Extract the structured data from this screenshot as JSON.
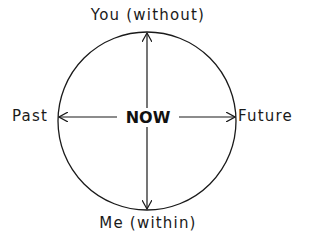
{
  "diagram": {
    "type": "compass-circle",
    "top_label": "You (without)",
    "bottom_label": "Me (within)",
    "left_label": "Past",
    "right_label": "Future",
    "center_label": "N O W",
    "center_text": "NOW",
    "colors": {
      "stroke": "#1a1a1a",
      "text": "#1a1a1a",
      "background": "#ffffff"
    }
  }
}
